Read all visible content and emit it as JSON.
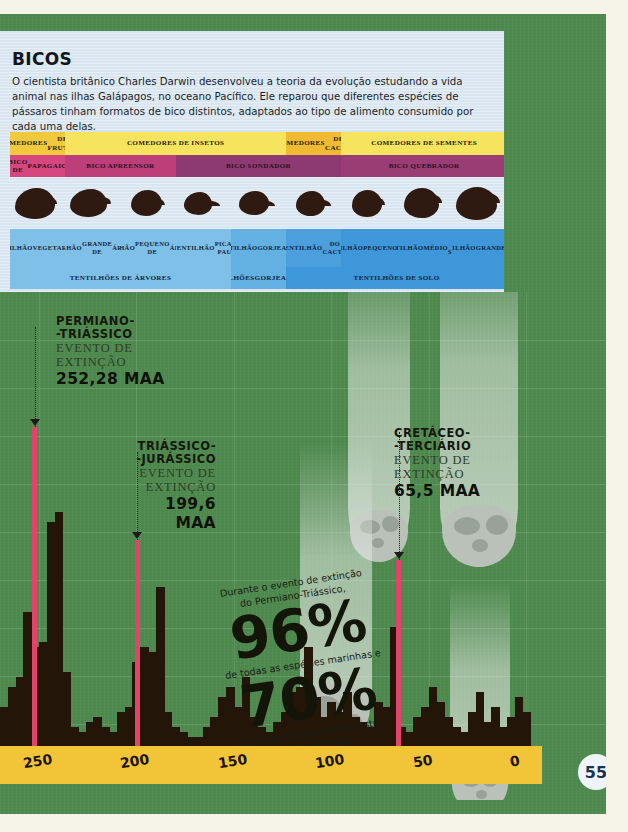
{
  "page": {
    "number": "55",
    "background_color": "#4e8a4e",
    "paper_color": "#f6f3e8"
  },
  "beaks_section": {
    "title": "BICOS",
    "body": "O cientista britânico Charles Darwin desenvolveu a teoria da evolução estudando a vida animal nas ilhas Galápagos, no oceano Pacífico. Ele reparou que diferentes espécies de pássaros tinham formatos de bico distintos, adaptados ao tipo de alimento consumido por cada uma delas.",
    "panel_color": "#d9e6f2",
    "diet_row": [
      {
        "label": "COMEDORES\nDE FRUTAS",
        "span": 1,
        "color": "#f0c93c"
      },
      {
        "label": "COMEDORES DE INSETOS",
        "span": 4,
        "color": "#f6e35e"
      },
      {
        "label": "COMEDORES\nDE CACTO",
        "span": 1,
        "color": "#f0bb33"
      },
      {
        "label": "COMEDORES DE SEMENTES",
        "span": 3,
        "color": "#f6e35e"
      }
    ],
    "beak_row": [
      {
        "label": "BICO DE\nPAPAGAIO",
        "span": 1,
        "color": "#d6477f"
      },
      {
        "label": "BICO APREENSOR",
        "span": 2,
        "color": "#bc3f79"
      },
      {
        "label": "BICO SONDADOR",
        "span": 3,
        "color": "#8e3a72"
      },
      {
        "label": "BICO QUEBRADOR",
        "span": 3,
        "color": "#9b3d75"
      }
    ],
    "species_row": [
      {
        "label": "TENTILHÃO\nVEGETARIANO",
        "color": "#7fc0e8"
      },
      {
        "label": "TENTILHÃO\nGRANDE DE\nÁRVORES",
        "color": "#7fc0e8"
      },
      {
        "label": "TENTILHÃO\nPEQUENO DE\nÁRVORES",
        "color": "#7fc0e8"
      },
      {
        "label": "TENTILHÃO\nPICA-PAU",
        "color": "#7fc0e8"
      },
      {
        "label": "TENTILHÃO\nGORJEADOR",
        "color": "#63b0e2"
      },
      {
        "label": "TENTILHÃO\nDO CACTO",
        "color": "#4a9fdc"
      },
      {
        "label": "TENTILHÃO\nPEQUENO\nDE SOLO",
        "color": "#3e97d8"
      },
      {
        "label": "TENTILHÃO\nMÉDIO\nDE SOLO",
        "color": "#3e97d8"
      },
      {
        "label": "TENTILHÃO\nGRANDE\nDE SOLO",
        "color": "#3e97d8"
      }
    ],
    "group_row": [
      {
        "label": "TENTILHÕES DE ÁRVORES",
        "span": 4,
        "color": "#7fc0e8"
      },
      {
        "label": "TENTILHÕES\nGORJEADORES",
        "span": 1,
        "color": "#63b0e2"
      },
      {
        "label": "TENTILHÕES DE SOLO",
        "span": 4,
        "color": "#3e97d8"
      }
    ],
    "silhouette_color": "#2e1a10"
  },
  "extinction_events": [
    {
      "name": "PERMIANO-\n-TRIÁSSICO",
      "line1": "PERMIANO-",
      "line2": "-TRIÁSSICO",
      "sub1": "EVENTO DE",
      "sub2": "EXTINÇÃO",
      "value": "252,28 MAA",
      "maa": 252.28,
      "marker_color": "#e1436a"
    },
    {
      "name": "TRIÁSSICO-\n-JURÁSSICO",
      "line1": "TRIÁSSICO-",
      "line2": "-JURÁSSICO",
      "sub1": "EVENTO DE",
      "sub2": "EXTINÇÃO",
      "value": "199,6",
      "value2": "MAA",
      "maa": 199.6,
      "marker_color": "#e1436a"
    },
    {
      "name": "CRETÁCEO-\n-TERCIÁRIO",
      "line1": "CRETÁCEO-",
      "line2": "-TERCIÁRIO",
      "sub1": "EVENTO DE",
      "sub2": "EXTINÇÃO",
      "value": "65,5 MAA",
      "maa": 65.5,
      "marker_color": "#e1436a"
    }
  ],
  "callout": {
    "intro_line1": "Durante o evento de extinção",
    "intro_line2": "do Permiano-Triássico,",
    "big1": "96%",
    "mid_line": "de todas as espécies marinhas e",
    "big2": "70%",
    "end_line1": "de todas as espécies terrestres",
    "end_line2": "desapareceram."
  },
  "chart_data": {
    "type": "bar",
    "title": "",
    "xlabel": "",
    "ylabel": "",
    "axis_color": "#f2c438",
    "xlim": [
      270,
      -8
    ],
    "tick_labels": [
      "250",
      "200",
      "150",
      "100",
      "50",
      "0"
    ],
    "tick_values": [
      250,
      200,
      150,
      100,
      50,
      0
    ],
    "grid": true,
    "note": "Extinction intensity histogram through geologic time (millions of years ago).",
    "x": [
      268,
      264,
      260,
      256,
      252,
      248,
      244,
      240,
      236,
      232,
      228,
      224,
      220,
      216,
      212,
      208,
      204,
      200,
      196,
      192,
      188,
      184,
      180,
      176,
      172,
      168,
      164,
      160,
      156,
      152,
      148,
      144,
      140,
      136,
      132,
      128,
      124,
      120,
      116,
      112,
      108,
      104,
      100,
      96,
      92,
      88,
      84,
      80,
      76,
      72,
      68,
      64,
      60,
      56,
      52,
      48,
      44,
      40,
      36,
      32,
      28,
      24,
      20,
      16,
      12,
      8,
      4,
      0
    ],
    "values": [
      22,
      30,
      34,
      60,
      46,
      48,
      96,
      100,
      36,
      14,
      12,
      16,
      18,
      14,
      12,
      20,
      22,
      40,
      46,
      44,
      70,
      20,
      14,
      12,
      10,
      10,
      14,
      18,
      26,
      30,
      22,
      34,
      18,
      14,
      12,
      16,
      20,
      28,
      30,
      46,
      26,
      18,
      24,
      20,
      28,
      18,
      16,
      14,
      24,
      22,
      54,
      14,
      12,
      18,
      22,
      30,
      24,
      18,
      14,
      12,
      20,
      28,
      16,
      22,
      14,
      18,
      26,
      20
    ],
    "bar_color": "#241509",
    "markers": [
      {
        "label": "252,28 MAA",
        "value": 252.28,
        "color": "#e1436a"
      },
      {
        "label": "199,6 MAA",
        "value": 199.6,
        "color": "#e1436a"
      },
      {
        "label": "65,5 MAA",
        "value": 65.5,
        "color": "#e1436a"
      }
    ]
  },
  "comets": [
    {
      "id": "comet-1"
    },
    {
      "id": "comet-2"
    },
    {
      "id": "comet-3"
    },
    {
      "id": "comet-4"
    }
  ]
}
